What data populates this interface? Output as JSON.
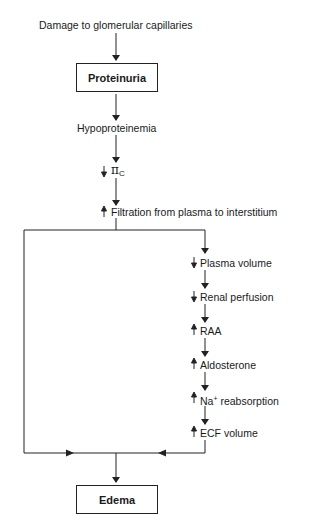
{
  "diagram": {
    "colors": {
      "line": "#222222",
      "text": "#1a1a1a",
      "background": "#ffffff"
    },
    "nodes": {
      "damage": {
        "label": "Damage to glomerular capillaries"
      },
      "proteinuria": {
        "label": "Proteinuria",
        "boxed": true
      },
      "hypoproteinemia": {
        "label": "Hypoproteinemia"
      },
      "pi_c": {
        "indicator": "↓",
        "symbol": "π",
        "subscript": "C"
      },
      "filtration": {
        "indicator": "↑",
        "label": "Filtration from plasma to interstitium"
      },
      "plasma_volume": {
        "indicator": "↓",
        "label": "Plasma volume"
      },
      "renal_perfusion": {
        "indicator": "↓",
        "label": "Renal perfusion"
      },
      "raa": {
        "indicator": "↑",
        "label": "RAA"
      },
      "aldosterone": {
        "indicator": "↑",
        "label": "Aldosterone"
      },
      "na_reabsorption": {
        "indicator": "↑",
        "prefix": "Na",
        "superscript": "+",
        "label": " reabsorption"
      },
      "ecf_volume": {
        "indicator": "↑",
        "label": "ECF volume"
      },
      "edema": {
        "label": "Edema",
        "boxed": true
      }
    },
    "edges": [
      [
        "damage",
        "proteinuria"
      ],
      [
        "proteinuria",
        "hypoproteinemia"
      ],
      [
        "hypoproteinemia",
        "pi_c"
      ],
      [
        "pi_c",
        "filtration"
      ],
      [
        "filtration",
        "plasma_volume"
      ],
      [
        "filtration",
        "edema"
      ],
      [
        "plasma_volume",
        "renal_perfusion"
      ],
      [
        "renal_perfusion",
        "raa"
      ],
      [
        "raa",
        "aldosterone"
      ],
      [
        "aldosterone",
        "na_reabsorption"
      ],
      [
        "na_reabsorption",
        "ecf_volume"
      ],
      [
        "ecf_volume",
        "edema"
      ]
    ]
  }
}
